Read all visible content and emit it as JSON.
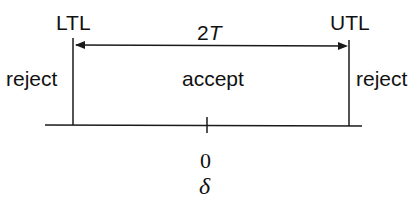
{
  "diagram": {
    "labels": {
      "lower_limit": "LTL",
      "upper_limit": "UTL",
      "width": "2",
      "width_var": "T",
      "left_region": "reject",
      "center_region": "accept",
      "right_region": "reject",
      "origin": "0",
      "axis_variable": "δ"
    },
    "colors": {
      "line": "#1a1a1a",
      "background": "#ffffff"
    }
  }
}
